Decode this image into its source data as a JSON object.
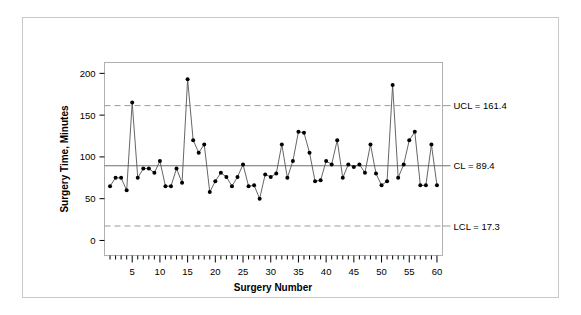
{
  "figure": {
    "background_color": "#ffffff",
    "border_color": "#c9c9c9"
  },
  "chart_data": {
    "type": "line",
    "title": "",
    "subtitle": "",
    "xlabel": "Surgery Number",
    "ylabel": "Surgery Time, Minutes",
    "xlim": [
      0,
      61
    ],
    "ylim": [
      -18,
      213
    ],
    "grid": false,
    "legend_position": "none",
    "marker": "filled-circle",
    "series_color": "#000000",
    "line_color": "#555555",
    "x": [
      1,
      2,
      3,
      4,
      5,
      6,
      7,
      8,
      9,
      10,
      11,
      12,
      13,
      14,
      15,
      16,
      17,
      18,
      19,
      20,
      21,
      22,
      23,
      24,
      25,
      26,
      27,
      28,
      29,
      30,
      31,
      32,
      33,
      34,
      35,
      36,
      37,
      38,
      39,
      40,
      41,
      42,
      43,
      44,
      45,
      46,
      47,
      48,
      49,
      50,
      51,
      52,
      53,
      54,
      55,
      56,
      57,
      58,
      59,
      60
    ],
    "values": [
      65,
      75,
      75,
      60,
      165,
      75,
      86,
      86,
      81,
      95,
      65,
      65,
      86,
      69,
      193,
      120,
      105,
      115,
      58,
      71,
      81,
      76,
      65,
      76,
      91,
      65,
      66,
      50,
      79,
      76,
      80,
      115,
      75,
      95,
      130,
      129,
      105,
      71,
      72,
      95,
      91,
      120,
      75,
      91,
      88,
      91,
      81,
      115,
      80,
      66,
      71,
      186,
      75,
      91,
      120,
      130,
      66,
      66,
      115,
      66
    ],
    "x_ticks": [
      5,
      10,
      15,
      20,
      25,
      30,
      35,
      40,
      45,
      50,
      55,
      60
    ],
    "x_minor_tick_step": 1,
    "y_ticks": [
      0,
      50,
      100,
      150,
      200
    ],
    "center_line": {
      "label": "CL = 89.4",
      "value": 89.4,
      "style": "solid",
      "color": "#6e6e6e"
    },
    "upper_control_limit": {
      "label": "UCL = 161.4",
      "value": 161.4,
      "style": "dashed",
      "color": "#9a9a9a"
    },
    "lower_control_limit": {
      "label": "LCL = 17.3",
      "value": 17.3,
      "style": "dashed",
      "color": "#9a9a9a"
    }
  }
}
